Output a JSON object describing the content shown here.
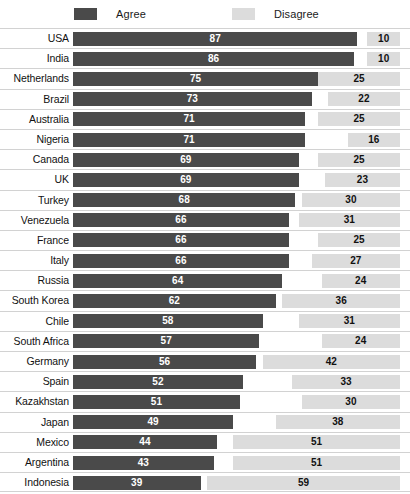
{
  "legend": {
    "items": [
      {
        "label": "Agree",
        "color": "#4a4a4a",
        "swatch_name": "agree-swatch"
      },
      {
        "label": "Disagree",
        "color": "#dcdcdc",
        "swatch_name": "disagree-swatch"
      }
    ]
  },
  "colors": {
    "agree": "#4a4a4a",
    "disagree": "#dcdcdc",
    "gridline": "#d2d2d2",
    "background": "#ffffff",
    "label_text": "#111111"
  },
  "chart_data": {
    "type": "bar",
    "orientation": "horizontal",
    "layout": "paired-opposed",
    "title": "",
    "subtitle": "",
    "xlabel": "",
    "ylabel": "",
    "xlim": [
      0,
      100
    ],
    "grid": true,
    "legend_position": "top",
    "categories": [
      "USA",
      "India",
      "Netherlands",
      "Brazil",
      "Australia",
      "Nigeria",
      "Canada",
      "UK",
      "Turkey",
      "Venezuela",
      "France",
      "Italy",
      "Russia",
      "South Korea",
      "Chile",
      "South Africa",
      "Germany",
      "Spain",
      "Kazakhstan",
      "Japan",
      "Mexico",
      "Argentina",
      "Indonesia"
    ],
    "series": [
      {
        "name": "Agree",
        "color": "#4a4a4a",
        "align": "left",
        "values": [
          87,
          86,
          75,
          73,
          71,
          71,
          69,
          69,
          68,
          66,
          66,
          66,
          64,
          62,
          58,
          57,
          56,
          52,
          51,
          49,
          44,
          43,
          39
        ]
      },
      {
        "name": "Disagree",
        "color": "#dcdcdc",
        "align": "right",
        "values": [
          10,
          10,
          25,
          22,
          25,
          16,
          25,
          23,
          30,
          31,
          25,
          27,
          24,
          36,
          31,
          24,
          42,
          33,
          30,
          38,
          51,
          51,
          59
        ]
      }
    ],
    "rows": [
      {
        "country": "USA",
        "agree": 87,
        "disagree": 10
      },
      {
        "country": "India",
        "agree": 86,
        "disagree": 10
      },
      {
        "country": "Netherlands",
        "agree": 75,
        "disagree": 25
      },
      {
        "country": "Brazil",
        "agree": 73,
        "disagree": 22
      },
      {
        "country": "Australia",
        "agree": 71,
        "disagree": 25
      },
      {
        "country": "Nigeria",
        "agree": 71,
        "disagree": 16
      },
      {
        "country": "Canada",
        "agree": 69,
        "disagree": 25
      },
      {
        "country": "UK",
        "agree": 69,
        "disagree": 23
      },
      {
        "country": "Turkey",
        "agree": 68,
        "disagree": 30
      },
      {
        "country": "Venezuela",
        "agree": 66,
        "disagree": 31
      },
      {
        "country": "France",
        "agree": 66,
        "disagree": 25
      },
      {
        "country": "Italy",
        "agree": 66,
        "disagree": 27
      },
      {
        "country": "Russia",
        "agree": 64,
        "disagree": 24
      },
      {
        "country": "South Korea",
        "agree": 62,
        "disagree": 36
      },
      {
        "country": "Chile",
        "agree": 58,
        "disagree": 31
      },
      {
        "country": "South Africa",
        "agree": 57,
        "disagree": 24
      },
      {
        "country": "Germany",
        "agree": 56,
        "disagree": 42
      },
      {
        "country": "Spain",
        "agree": 52,
        "disagree": 33
      },
      {
        "country": "Kazakhstan",
        "agree": 51,
        "disagree": 30
      },
      {
        "country": "Japan",
        "agree": 49,
        "disagree": 38
      },
      {
        "country": "Mexico",
        "agree": 44,
        "disagree": 51
      },
      {
        "country": "Argentina",
        "agree": 43,
        "disagree": 51
      },
      {
        "country": "Indonesia",
        "agree": 39,
        "disagree": 59
      }
    ]
  }
}
